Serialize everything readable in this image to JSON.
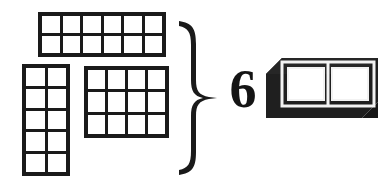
{
  "figure": {
    "background_color": "#ffffff",
    "ink_color": "#1a1a1a"
  },
  "numeral": {
    "value": "6",
    "color": "#141414"
  },
  "brace": {
    "orientation": "right-facing",
    "glyph_name": "curly-brace",
    "color": "#1a1a1a"
  },
  "unit_block": {
    "label": "1 by 2 unit block",
    "cells": 2,
    "columns": 2,
    "rows": 1,
    "body_color": "#1f1f1f",
    "face_color": "#ffffff",
    "edge_color": "#f2f2f2"
  },
  "grids": [
    {
      "id": "grid-top",
      "name": "top-array",
      "columns": 6,
      "rows": 2,
      "cells": 12,
      "cell_labels": [
        "",
        "",
        "",
        "",
        "",
        "",
        "",
        "",
        "",
        "",
        "",
        ""
      ]
    },
    {
      "id": "grid-left",
      "name": "left-array",
      "columns": 2,
      "rows": 5,
      "cells": 10,
      "cell_labels": [
        "",
        "",
        "",
        "",
        "",
        "",
        "",
        "",
        "",
        ""
      ]
    },
    {
      "id": "grid-mid",
      "name": "middle-array",
      "columns": 4,
      "rows": 3,
      "cells": 12,
      "cell_labels": [
        "",
        "",
        "",
        "",
        "",
        "",
        "",
        "",
        "",
        "",
        "",
        ""
      ]
    }
  ]
}
